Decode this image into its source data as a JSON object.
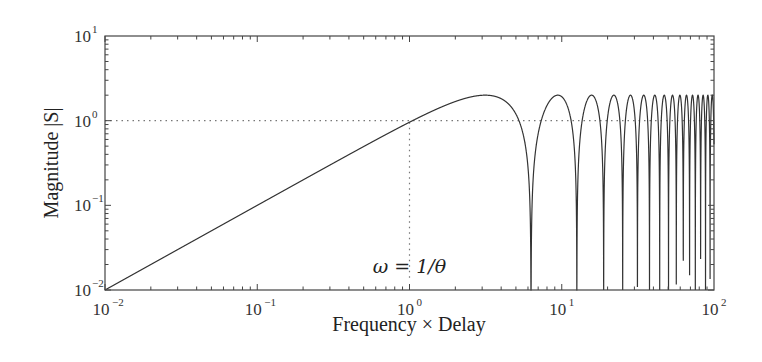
{
  "chart_data": {
    "type": "line",
    "title": "",
    "xlabel": "Frequency × Delay",
    "ylabel": "Magnitude |S|",
    "xscale": "log",
    "yscale": "log",
    "xlim": [
      0.01,
      100
    ],
    "ylim": [
      0.01,
      10
    ],
    "x_ticks": [
      {
        "base": "10",
        "exp": "−2",
        "value": 0.01
      },
      {
        "base": "10",
        "exp": "−1",
        "value": 0.1
      },
      {
        "base": "10",
        "exp": "0",
        "value": 1
      },
      {
        "base": "10",
        "exp": "1",
        "value": 10
      },
      {
        "base": "10",
        "exp": "2",
        "value": 100
      }
    ],
    "y_ticks": [
      {
        "base": "10",
        "exp": "−2",
        "value": 0.01
      },
      {
        "base": "10",
        "exp": "−1",
        "value": 0.1
      },
      {
        "base": "10",
        "exp": "0",
        "value": 1
      },
      {
        "base": "10",
        "exp": "1",
        "value": 10
      }
    ],
    "grid": false,
    "series": [
      {
        "name": "|S| = |1 − e^{−jωθ}| = 2|sin(ωθ/2)|",
        "formula": "2*abs(sin(x/2))",
        "color": "#333333",
        "sample_points": [
          {
            "x": 0.01,
            "y": 0.01
          },
          {
            "x": 0.1,
            "y": 0.1
          },
          {
            "x": 1,
            "y": 0.96
          },
          {
            "x": 3.14,
            "y": 2.0
          },
          {
            "x": 6.28,
            "y": 0.0
          },
          {
            "x": 9.42,
            "y": 2.0
          },
          {
            "x": 12.57,
            "y": 0.0
          },
          {
            "x": 15.71,
            "y": 2.0
          },
          {
            "x": 18.85,
            "y": 0.0
          },
          {
            "x": 100,
            "y": 0.53
          }
        ],
        "peak_value": 2,
        "null_spacing": 6.283
      }
    ],
    "reference_lines": [
      {
        "type": "horizontal",
        "y": 1,
        "style": "dotted",
        "x_from": 0.01,
        "x_to": 100
      },
      {
        "type": "vertical",
        "x": 1,
        "style": "dotted",
        "y_from": 0.014,
        "y_to": 1
      }
    ],
    "annotations": [
      {
        "text": "ω = 1/θ",
        "x": 1,
        "y": 0.013
      }
    ]
  },
  "frame": {
    "left": 105,
    "right": 714,
    "top": 36,
    "bottom": 290,
    "line_color": "#444444",
    "curve_color": "#333333",
    "ref_color": "#777777"
  }
}
